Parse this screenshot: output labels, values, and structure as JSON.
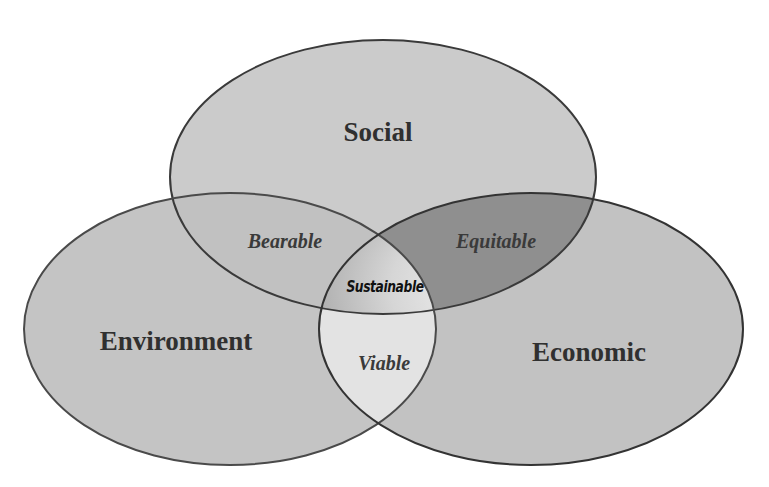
{
  "diagram": {
    "type": "venn",
    "title": "",
    "sets": [
      {
        "id": "social",
        "label": "Social",
        "fill": "#cbcbcb"
      },
      {
        "id": "environment",
        "label": "Environment",
        "fill": "#c4c4c4"
      },
      {
        "id": "economic",
        "label": "Economic",
        "fill": "#c2c2c2"
      }
    ],
    "intersections": [
      {
        "sets": [
          "social",
          "environment"
        ],
        "label": "Bearable",
        "fill": "#c0c0c0"
      },
      {
        "sets": [
          "social",
          "economic"
        ],
        "label": "Equitable",
        "fill": "#8f8f8f"
      },
      {
        "sets": [
          "environment",
          "economic"
        ],
        "label": "Viable",
        "fill": "#e3e3e3"
      },
      {
        "sets": [
          "social",
          "environment",
          "economic"
        ],
        "label": "Sustainable",
        "fill": "#b5b5b5"
      }
    ],
    "outline_color": "#3a3a3a"
  }
}
